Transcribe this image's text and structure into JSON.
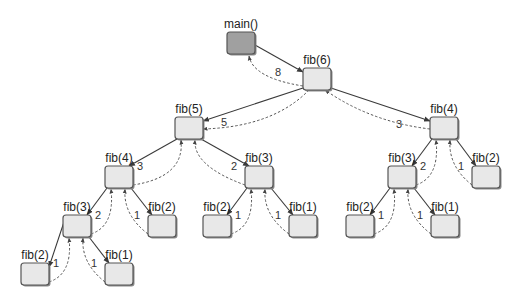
{
  "diagram": {
    "colors": {
      "root_fill": "#a0a0a0",
      "node_fill": "#e8e8e8",
      "border": "#555555",
      "edge": "#3a3a3a"
    },
    "nodes": [
      {
        "id": "main",
        "label": "main()",
        "x": 227,
        "y": 32,
        "root": true
      },
      {
        "id": "f6",
        "label": "fib(6)",
        "x": 303,
        "y": 68
      },
      {
        "id": "f5",
        "label": "fib(5)",
        "x": 175,
        "y": 117
      },
      {
        "id": "f4r",
        "label": "fib(4)",
        "x": 430,
        "y": 117
      },
      {
        "id": "f4l",
        "label": "fib(4)",
        "x": 105,
        "y": 166
      },
      {
        "id": "f3m",
        "label": "fib(3)",
        "x": 245,
        "y": 166
      },
      {
        "id": "f3r",
        "label": "fib(3)",
        "x": 388,
        "y": 166
      },
      {
        "id": "f2r",
        "label": "fib(2)",
        "x": 472,
        "y": 166
      },
      {
        "id": "f3l",
        "label": "fib(3)",
        "x": 63,
        "y": 215
      },
      {
        "id": "f2l",
        "label": "fib(2)",
        "x": 148,
        "y": 215
      },
      {
        "id": "f2m",
        "label": "fib(2)",
        "x": 203,
        "y": 215
      },
      {
        "id": "f1m",
        "label": "fib(1)",
        "x": 289,
        "y": 215
      },
      {
        "id": "f2rr",
        "label": "fib(2)",
        "x": 346,
        "y": 215
      },
      {
        "id": "f1rr",
        "label": "fib(1)",
        "x": 431,
        "y": 215
      },
      {
        "id": "f2ll",
        "label": "fib(2)",
        "x": 21,
        "y": 263
      },
      {
        "id": "f1ll",
        "label": "fib(1)",
        "x": 105,
        "y": 263
      }
    ],
    "edges": [
      {
        "from": "main",
        "to": "f6",
        "return_value": "8"
      },
      {
        "from": "f6",
        "to": "f5",
        "return_value": "5"
      },
      {
        "from": "f6",
        "to": "f4r",
        "return_value": "3"
      },
      {
        "from": "f5",
        "to": "f4l",
        "return_value": "3"
      },
      {
        "from": "f5",
        "to": "f3m",
        "return_value": "2"
      },
      {
        "from": "f4r",
        "to": "f3r",
        "return_value": "2"
      },
      {
        "from": "f4r",
        "to": "f2r",
        "return_value": "1"
      },
      {
        "from": "f4l",
        "to": "f3l",
        "return_value": "2"
      },
      {
        "from": "f4l",
        "to": "f2l",
        "return_value": "1"
      },
      {
        "from": "f3m",
        "to": "f2m",
        "return_value": "1"
      },
      {
        "from": "f3m",
        "to": "f1m",
        "return_value": "1"
      },
      {
        "from": "f3r",
        "to": "f2rr",
        "return_value": "1"
      },
      {
        "from": "f3r",
        "to": "f1rr",
        "return_value": "1"
      },
      {
        "from": "f3l",
        "to": "f2ll",
        "return_value": "1"
      },
      {
        "from": "f3l",
        "to": "f1ll",
        "return_value": "1"
      }
    ]
  }
}
